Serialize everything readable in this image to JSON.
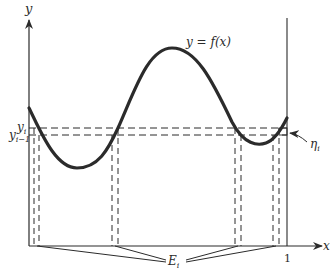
{
  "diagram": {
    "title": "",
    "labels": {
      "y_axis": "y",
      "x_axis": "x",
      "curve": "y = f(x)",
      "y_i": "y",
      "y_i_sub": "i",
      "y_im1": "y",
      "y_im1_sub": "i−1",
      "eta": "η",
      "eta_sub": "i",
      "E": "E",
      "E_sub": "i",
      "one": "1"
    },
    "colors": {
      "ink": "#2b2b2b",
      "background": "#ffffff"
    }
  }
}
